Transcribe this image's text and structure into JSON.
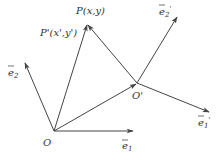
{
  "diagram": {
    "type": "vector-coordinate-translation",
    "points": {
      "O": {
        "label": "O",
        "x": 54,
        "y": 131
      },
      "O_prime": {
        "label": "O'",
        "x": 137,
        "y": 83
      },
      "P": {
        "label": "P(x,y)",
        "x": 87,
        "y": 24
      },
      "P_prime_label": {
        "label": "P'(x',y')"
      }
    },
    "vectors": {
      "e1": {
        "label": "e",
        "subscript": "1",
        "prime": "",
        "from": "O",
        "to": [
          134,
          131
        ]
      },
      "e2": {
        "label": "e",
        "subscript": "2",
        "prime": "",
        "from": "O",
        "to": [
          24,
          62
        ]
      },
      "e1_prime": {
        "label": "e",
        "subscript": "1",
        "prime": "'",
        "from": "O_prime",
        "to": [
          210,
          112
        ]
      },
      "e2_prime": {
        "label": "e",
        "subscript": "2",
        "prime": "'",
        "from": "O_prime",
        "to": [
          178,
          16
        ]
      }
    },
    "segments": [
      {
        "from": "O",
        "to": "P",
        "arrow": true
      },
      {
        "from": "O",
        "to": "O_prime",
        "arrow": true
      },
      {
        "from": "O_prime",
        "to": "P",
        "arrow": true
      }
    ],
    "stroke_color": "#444444"
  }
}
